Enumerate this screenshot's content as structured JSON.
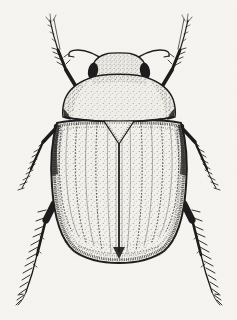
{
  "figure": {
    "title": "Beetle illustration",
    "subject": "beetle",
    "style": "pen-and-ink stipple scientific illustration",
    "view": "dorsal (top-down) view",
    "palette": {
      "ink": "#1b1b1b",
      "paper": "#f7f5f1",
      "shading": "#6b675e"
    },
    "parts": [
      "head",
      "eyes",
      "antennae",
      "pronotum",
      "scutellum",
      "elytra",
      "elytral suture",
      "front legs",
      "middle legs",
      "hind legs",
      "leg spines",
      "tarsal claws"
    ]
  }
}
